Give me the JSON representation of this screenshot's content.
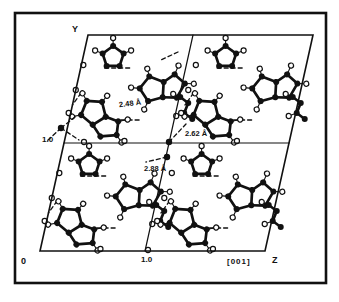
{
  "figure": {
    "kind": "crystal-packing-diagram",
    "labels": {
      "axis_y": "Y",
      "origin": "0",
      "y_tick": "1.0",
      "z_tick": "1.0",
      "direction": "[001]",
      "axis_z": "Z"
    },
    "distances": {
      "d1": "2.48 Å",
      "d2": "2.62 Å",
      "d3": "2.88 Å"
    },
    "colors": {
      "ink": "#111111",
      "paper": "#ffffff"
    },
    "geometry": {
      "frame": [
        15,
        13,
        311,
        270
      ],
      "cell_corner": [
        88,
        35
      ],
      "cell_w": 112.5,
      "cell_h": 108,
      "shear": 0.2222,
      "outline": [
        [
          88,
          35
        ],
        [
          313,
          35
        ],
        [
          265,
          251
        ],
        [
          40,
          251
        ]
      ],
      "divider_h": [
        [
          64,
          143
        ],
        [
          289,
          143
        ]
      ],
      "divider_v": [
        [
          193,
          35
        ],
        [
          145,
          251
        ]
      ]
    },
    "templates": {
      "penta": {
        "atoms": [
          [
            0,
            -11
          ],
          [
            10.5,
            -3.4
          ],
          [
            6.5,
            8.9
          ],
          [
            -6.5,
            8.9
          ],
          [
            -10.5,
            -3.4
          ]
        ],
        "bonds": [
          [
            0,
            1
          ],
          [
            1,
            2
          ],
          [
            2,
            3
          ],
          [
            3,
            4
          ],
          [
            4,
            0
          ]
        ],
        "hydrogens": [
          {
            "at": 0,
            "pos": [
              0,
              -19
            ]
          },
          {
            "at": 4,
            "pos": [
              -18,
              -6.5
            ]
          },
          {
            "at": 1,
            "pos": [
              18,
              -6.5
            ]
          }
        ]
      },
      "bicyc": {
        "atoms": [
          [
            -8,
            -13
          ],
          [
            4.4,
            -4
          ],
          [
            -0.4,
            10.5
          ],
          [
            -15.6,
            10.5
          ],
          [
            -20.4,
            -4
          ],
          [
            17,
            -8.5
          ],
          [
            24.5,
            3
          ],
          [
            13,
            14.5
          ]
        ],
        "bonds": [
          [
            0,
            1
          ],
          [
            1,
            2
          ],
          [
            2,
            3
          ],
          [
            3,
            4
          ],
          [
            4,
            0
          ],
          [
            1,
            5
          ],
          [
            5,
            6
          ],
          [
            6,
            7
          ],
          [
            7,
            2
          ]
        ],
        "hydrogens": [
          {
            "at": 0,
            "pos": [
              -8,
              -21
            ]
          },
          {
            "at": 4,
            "pos": [
              -28.5,
              -7
            ]
          },
          {
            "at": 3,
            "pos": [
              -21.5,
              17.5
            ]
          },
          {
            "at": 5,
            "pos": [
              23,
              -16
            ]
          },
          {
            "at": 6,
            "pos": [
              33,
              5.5
            ]
          }
        ]
      },
      "chain": {
        "atoms": [
          [
            0,
            0
          ],
          [
            8,
            6
          ],
          [
            4,
            16
          ],
          [
            12,
            22
          ]
        ],
        "bonds": [
          [
            0,
            1
          ],
          [
            1,
            2
          ],
          [
            2,
            3
          ]
        ],
        "hydrogens": [
          {
            "at": 0,
            "pos": [
              -7,
              -3
            ]
          },
          {
            "at": 2,
            "pos": [
              -4,
              19
            ]
          }
        ]
      }
    },
    "cell_motifs": [
      {
        "t": "penta",
        "rel": [
          30,
          22
        ],
        "rot": 0
      },
      {
        "t": "bicyc",
        "rel": [
          84,
          52
        ],
        "rot": -15
      },
      {
        "t": "bicyc",
        "rel": [
          30,
          82
        ],
        "rot": 40
      },
      {
        "t": "chain",
        "rel": [
          106,
          62
        ],
        "rot": 0
      }
    ],
    "cell_dashes": [
      [
        [
          24,
          33
        ],
        [
          50,
          33
        ]
      ],
      [
        [
          52,
          85
        ],
        [
          72,
          85
        ]
      ],
      [
        [
          6,
          58
        ],
        [
          0,
          70
        ]
      ]
    ],
    "cell_edge_hydrogens": [
      [
        60,
        106
      ],
      [
        2,
        30
      ],
      [
        0,
        55
      ],
      [
        -2,
        78
      ]
    ],
    "junctions": {
      "atoms": [
        [
          61,
          128
        ],
        [
          167,
          157
        ],
        [
          169,
          142
        ]
      ],
      "circles": [
        [
          148,
          250
        ],
        [
          84,
          142
        ]
      ],
      "dashes": [
        [
          [
            61,
            128
          ],
          [
            75,
            117
          ]
        ],
        [
          [
            61,
            128
          ],
          [
            79,
            140
          ]
        ],
        [
          [
            61,
            128
          ],
          [
            47,
            141
          ]
        ],
        [
          [
            167,
            157
          ],
          [
            146,
            162
          ]
        ],
        [
          [
            169,
            142
          ],
          [
            186,
            124
          ]
        ],
        [
          [
            178,
            52
          ],
          [
            161,
            60
          ]
        ]
      ]
    }
  }
}
